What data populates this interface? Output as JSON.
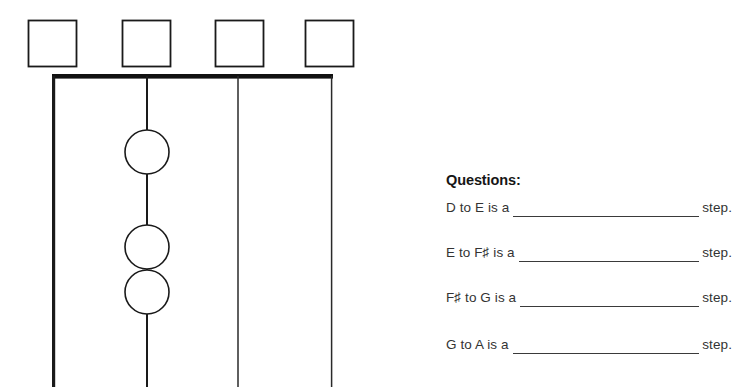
{
  "page": {
    "background_color": "#ffffff",
    "ink_color": "#1a1a1a"
  },
  "diagram": {
    "name": "keyboard-step-diagram",
    "nut_bar": {
      "x1": 52,
      "x2": 333,
      "y": 76,
      "thickness": 5,
      "color": "#111111"
    },
    "answer_boxes": [
      {
        "id": "box-1",
        "x": 28,
        "y": 20,
        "width": 48,
        "height": 46,
        "value": ""
      },
      {
        "id": "box-2",
        "x": 122,
        "y": 20,
        "width": 48,
        "height": 46,
        "value": ""
      },
      {
        "id": "box-3",
        "x": 215,
        "y": 20,
        "width": 48,
        "height": 46,
        "value": ""
      },
      {
        "id": "box-4",
        "x": 305,
        "y": 20,
        "width": 48,
        "height": 46,
        "value": ""
      }
    ],
    "vertical_lines": [
      {
        "id": "line-1",
        "x": 52,
        "y1": 76,
        "y2": 387,
        "stroke_width": 3.2
      },
      {
        "id": "line-2",
        "x": 147,
        "y1": 76,
        "y2": 387,
        "stroke_width": 2.0
      },
      {
        "id": "line-3",
        "x": 238,
        "y1": 76,
        "y2": 387,
        "stroke_width": 1.5
      },
      {
        "id": "line-4",
        "x": 332,
        "y1": 76,
        "y2": 387,
        "stroke_width": 1.5
      }
    ],
    "circles": [
      {
        "id": "circle-1",
        "cx": 147,
        "cy": 152,
        "r": 22,
        "value": ""
      },
      {
        "id": "circle-2",
        "cx": 147,
        "cy": 247,
        "r": 22,
        "value": ""
      },
      {
        "id": "circle-3",
        "cx": 147,
        "cy": 292,
        "r": 22,
        "value": ""
      }
    ]
  },
  "questions": {
    "heading": "Questions:",
    "items": [
      {
        "prompt": "D to E is a",
        "answer": "",
        "suffix": "step."
      },
      {
        "prompt": "E to F♯  is a",
        "answer": "",
        "suffix": "step."
      },
      {
        "prompt": "F♯  to G is a",
        "answer": "",
        "suffix": "step."
      },
      {
        "prompt": "G to A is a",
        "answer": "",
        "suffix": "step."
      }
    ]
  }
}
